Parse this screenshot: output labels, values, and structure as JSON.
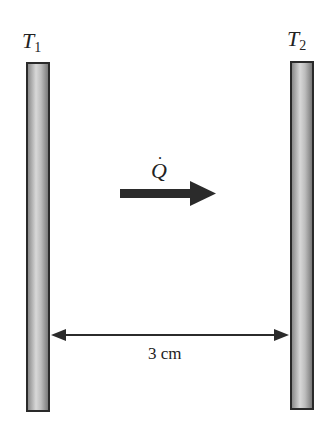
{
  "diagram": {
    "plates": [
      {
        "id": "left",
        "temperature_label": "T",
        "subscript": "1"
      },
      {
        "id": "right",
        "temperature_label": "T",
        "subscript": "2"
      }
    ],
    "heat_flow": {
      "symbol": "Q",
      "dot": "˙",
      "direction": "left-to-right"
    },
    "dimension": {
      "label": "3 cm"
    },
    "colors": {
      "plate_border": "#2a2a2a",
      "arrow": "#2b2b2b",
      "text": "#222222"
    }
  }
}
